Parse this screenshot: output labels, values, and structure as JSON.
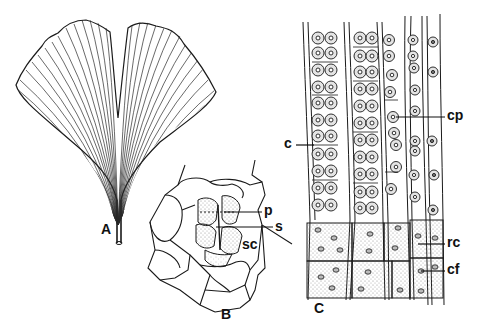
{
  "figure": {
    "panels": [
      {
        "id": "A",
        "label": "A",
        "subject": "leaf"
      },
      {
        "id": "B",
        "label": "B",
        "subject": "stomatal-apparatus"
      },
      {
        "id": "C",
        "label": "C",
        "subject": "tissue-section"
      }
    ],
    "annotations": {
      "B": [
        {
          "key": "p",
          "label": "p"
        },
        {
          "key": "s",
          "label": "s"
        },
        {
          "key": "sc",
          "label": "sc"
        }
      ],
      "C": [
        {
          "key": "c",
          "label": "c"
        },
        {
          "key": "cp",
          "label": "cp"
        },
        {
          "key": "rc",
          "label": "rc"
        },
        {
          "key": "cf",
          "label": "cf"
        }
      ]
    },
    "colors": {
      "ink": "#1a1a1a",
      "background": "#ffffff",
      "stipple": "#9a9a9a"
    }
  }
}
